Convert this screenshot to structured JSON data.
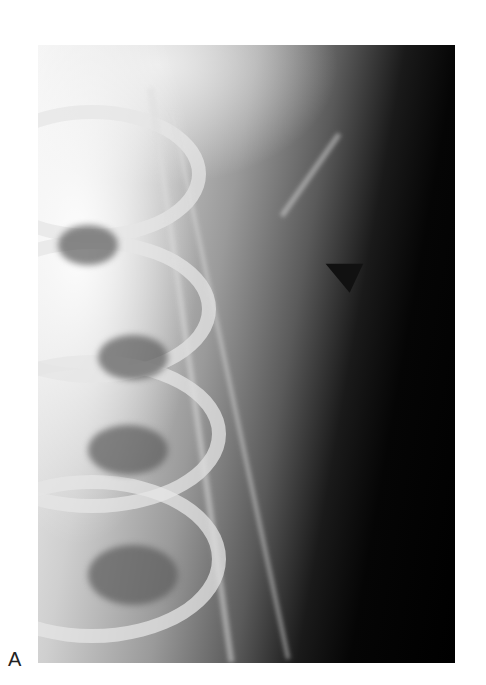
{
  "figure": {
    "panel_label": "A",
    "image_description": "Shoulder radiograph with arrow pointing to soft tissue",
    "annotation": "arrow-indicator"
  }
}
